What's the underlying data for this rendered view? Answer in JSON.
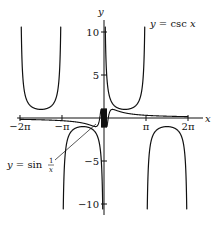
{
  "chart_data": {
    "type": "line",
    "title": "",
    "xlabel": "x",
    "ylabel": "y",
    "xlim": [
      -6.8,
      7.0
    ],
    "ylim": [
      -11.2,
      11.2
    ],
    "x_ticks": [
      {
        "value": -6.2832,
        "label": "−2π"
      },
      {
        "value": -3.1416,
        "label": "−π"
      },
      {
        "value": 3.1416,
        "label": "π"
      },
      {
        "value": 6.2832,
        "label": "2π"
      }
    ],
    "y_ticks": [
      {
        "value": 10,
        "label": "10"
      },
      {
        "value": 5,
        "label": "5"
      },
      {
        "value": -5,
        "label": "−5"
      },
      {
        "value": -10,
        "label": "−10"
      }
    ],
    "series": [
      {
        "name": "y = csc x",
        "function": "1/sin(x)",
        "domain": [
          -6.2832,
          6.2832
        ]
      },
      {
        "name": "y = sin 1/x",
        "function": "sin(1/x)",
        "domain": [
          -6.2832,
          6.2832
        ]
      }
    ],
    "annotations": [
      {
        "text": "y = csc x",
        "position": "upper right"
      },
      {
        "text": "y = sin 1/x",
        "position": "lower left, with pointer line"
      }
    ],
    "grid": false,
    "legend": "none"
  },
  "labels": {
    "x_axis": "x",
    "y_axis": "y",
    "csc_label": "y = csc x",
    "sin_label_prefix": "y = sin",
    "sin_label_num": "1",
    "sin_label_den": "x",
    "ticks_x": [
      "−2π",
      "−π",
      "π",
      "2π"
    ],
    "ticks_y": [
      "10",
      "5",
      "−5",
      "−10"
    ]
  }
}
